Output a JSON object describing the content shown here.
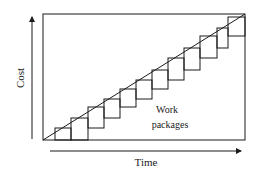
{
  "diagram": {
    "x_axis_label": "Time",
    "y_axis_label": "Cost",
    "annotation_line1": "Work",
    "annotation_line2": "packages",
    "stroke_color": "#1a1a1a",
    "frame": {
      "x1": 43,
      "y1": 14,
      "x2": 245,
      "y2": 140
    },
    "diagonal": {
      "x1": 43,
      "y1": 140,
      "x2": 245,
      "y2": 14
    },
    "steps": [
      {
        "x": 55,
        "y": 128,
        "w": 16,
        "h": 12
      },
      {
        "x": 71,
        "y": 118,
        "w": 17,
        "h": 22
      },
      {
        "x": 88,
        "y": 107,
        "w": 16,
        "h": 21
      },
      {
        "x": 104,
        "y": 99,
        "w": 16,
        "h": 19
      },
      {
        "x": 120,
        "y": 89,
        "w": 16,
        "h": 18
      },
      {
        "x": 136,
        "y": 80,
        "w": 16,
        "h": 19
      },
      {
        "x": 152,
        "y": 70,
        "w": 16,
        "h": 19
      },
      {
        "x": 168,
        "y": 58,
        "w": 16,
        "h": 22
      },
      {
        "x": 184,
        "y": 48,
        "w": 16,
        "h": 22
      },
      {
        "x": 200,
        "y": 36,
        "w": 17,
        "h": 22
      },
      {
        "x": 217,
        "y": 28,
        "w": 11,
        "h": 20
      },
      {
        "x": 228,
        "y": 17,
        "w": 17,
        "h": 19
      }
    ]
  }
}
